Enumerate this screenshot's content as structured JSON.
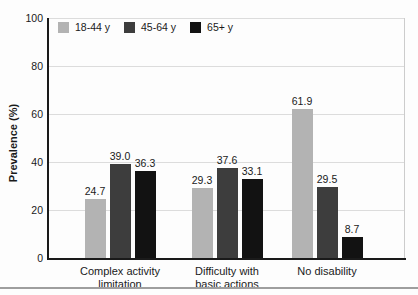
{
  "chart_data": {
    "type": "bar",
    "title": "",
    "xlabel": "",
    "ylabel": "Prevalence (%)",
    "ylim": [
      0,
      100
    ],
    "yticks": [
      0,
      20,
      40,
      60,
      80,
      100
    ],
    "grid": true,
    "legend_position": "top-left",
    "categories": [
      "Complex activity\nlimitation",
      "Difficulty with\nbasic actions",
      "No disability"
    ],
    "series": [
      {
        "name": "18-44 y",
        "color": "#b3b3b3",
        "values": [
          24.7,
          29.3,
          61.9
        ]
      },
      {
        "name": "45-64 y",
        "color": "#3d3d3d",
        "values": [
          39.0,
          37.6,
          29.5
        ]
      },
      {
        "name": "65+ y",
        "color": "#121212",
        "values": [
          36.3,
          33.1,
          8.7
        ]
      }
    ],
    "value_label_decimals": 1
  },
  "colors": {
    "grid": "#dcdcdc",
    "frame": "#cccccc",
    "axis": "#1a1a1a",
    "text": "#1a1a1a",
    "bottom_rule": "#9e9e9e",
    "background": "#fdfdfd"
  }
}
